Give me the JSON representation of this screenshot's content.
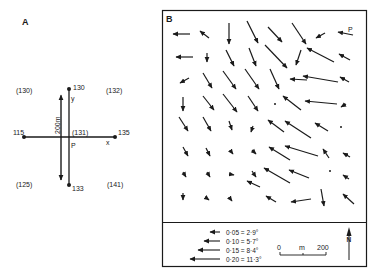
{
  "panel_a": {
    "label": "A",
    "center_label": "P",
    "center_value": "(131)",
    "axis_x_label": "x",
    "axis_y_label": "y",
    "scale_label": "200m",
    "points": {
      "top": "130",
      "bottom": "133",
      "left": "115",
      "right": "135"
    },
    "corners": {
      "top_left": "(130)",
      "top_right": "(132)",
      "bottom_left": "(125)",
      "bottom_right": "(141)"
    }
  },
  "panel_b": {
    "label": "B",
    "point_label": "P",
    "legend": [
      {
        "value": "0·05 = 2·9°",
        "length_px": 10
      },
      {
        "value": "0·10 = 5·7°",
        "length_px": 16
      },
      {
        "value": "0·15 = 8·4°",
        "length_px": 22
      },
      {
        "value": "0·20 = 11·3°",
        "length_px": 30
      }
    ],
    "scale_bar": {
      "start": "0",
      "unit": "m",
      "end": "200"
    },
    "north_label": "N",
    "arrows": [
      [
        190,
        34,
        173,
        34
      ],
      [
        209,
        38,
        200,
        31
      ],
      [
        229,
        23,
        229,
        44
      ],
      [
        247,
        21,
        258,
        43
      ],
      [
        268,
        27,
        282,
        42
      ],
      [
        292,
        23,
        306,
        44
      ],
      [
        325,
        33,
        316,
        38
      ],
      [
        353,
        35,
        338,
        32
      ],
      [
        193,
        57,
        176,
        57
      ],
      [
        207,
        53,
        207,
        62
      ],
      [
        226,
        50,
        234,
        66
      ],
      [
        249,
        48,
        256,
        66
      ],
      [
        265,
        45,
        287,
        68
      ],
      [
        301,
        50,
        296,
        65
      ],
      [
        334,
        62,
        307,
        48
      ],
      [
        350,
        60,
        339,
        54
      ],
      [
        189,
        78,
        180,
        83
      ],
      [
        203,
        73,
        212,
        88
      ],
      [
        223,
        71,
        236,
        89
      ],
      [
        245,
        69,
        259,
        89
      ],
      [
        270,
        69,
        279,
        89
      ],
      [
        307,
        80,
        290,
        79
      ],
      [
        338,
        82,
        303,
        76
      ],
      [
        349,
        82,
        340,
        77
      ],
      [
        183,
        97,
        183,
        111
      ],
      [
        203,
        96,
        214,
        110
      ],
      [
        223,
        94,
        237,
        112
      ],
      [
        248,
        96,
        258,
        111
      ],
      [
        301,
        110,
        283,
        96
      ],
      [
        337,
        104,
        305,
        101
      ],
      [
        346,
        104,
        341,
        107
      ],
      [
        179,
        117,
        188,
        131
      ],
      [
        203,
        117,
        211,
        131
      ],
      [
        229,
        121,
        232,
        130
      ],
      [
        253,
        126,
        251,
        132
      ],
      [
        284,
        132,
        268,
        120
      ],
      [
        311,
        138,
        285,
        121
      ],
      [
        328,
        131,
        315,
        123
      ],
      [
        183,
        147,
        188,
        156
      ],
      [
        206,
        148,
        210,
        156
      ],
      [
        230,
        150,
        233,
        154
      ],
      [
        252,
        150,
        256,
        154
      ],
      [
        290,
        160,
        269,
        147
      ],
      [
        318,
        156,
        285,
        146
      ],
      [
        329,
        158,
        323,
        149
      ],
      [
        350,
        157,
        343,
        153
      ],
      [
        183,
        172,
        186,
        177
      ],
      [
        207,
        172,
        210,
        177
      ],
      [
        229,
        174,
        234,
        175
      ],
      [
        252,
        171,
        256,
        177
      ],
      [
        290,
        183,
        264,
        168
      ],
      [
        309,
        178,
        289,
        170
      ],
      [
        349,
        179,
        343,
        175
      ],
      [
        183,
        193,
        183,
        200
      ],
      [
        205,
        197,
        209,
        200
      ],
      [
        229,
        197,
        232,
        201
      ],
      [
        260,
        187,
        247,
        181
      ],
      [
        276,
        202,
        266,
        196
      ],
      [
        311,
        199,
        291,
        202
      ],
      [
        321,
        189,
        324,
        206
      ],
      [
        354,
        204,
        343,
        194
      ]
    ],
    "dots": [
      [
        275,
        104
      ],
      [
        341,
        127
      ],
      [
        330,
        171
      ]
    ]
  }
}
